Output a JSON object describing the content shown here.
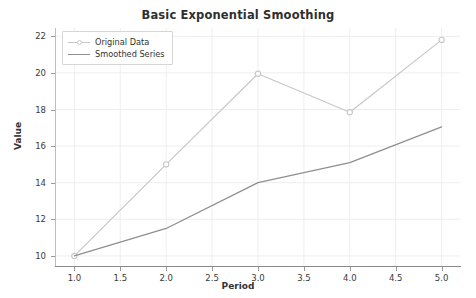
{
  "chart_data": {
    "type": "line",
    "title": "Basic Exponential Smoothing",
    "xlabel": "Period",
    "ylabel": "Value",
    "x": [
      1.0,
      2.0,
      3.0,
      4.0,
      5.0
    ],
    "series": [
      {
        "name": "Original Data",
        "values": [
          10.0,
          15.0,
          19.95,
          17.85,
          21.8
        ],
        "color": "#c8c8c8",
        "marker": "circle",
        "linewidth": 1.2
      },
      {
        "name": "Smoothed Series",
        "values": [
          10.0,
          11.5,
          14.0,
          15.1,
          17.05
        ],
        "color": "#8f8f8f",
        "marker": "none",
        "linewidth": 1.3
      }
    ],
    "xlim": [
      0.8,
      5.2
    ],
    "ylim": [
      9.45,
      22.45
    ],
    "xticks": [
      "1.0",
      "1.5",
      "2.0",
      "2.5",
      "3.0",
      "3.5",
      "4.0",
      "4.5",
      "5.0"
    ],
    "xtick_values": [
      1.0,
      1.5,
      2.0,
      2.5,
      3.0,
      3.5,
      4.0,
      4.5,
      5.0
    ],
    "yticks": [
      "10",
      "12",
      "14",
      "16",
      "18",
      "20",
      "22"
    ],
    "ytick_values": [
      10,
      12,
      14,
      16,
      18,
      20,
      22
    ],
    "grid": true,
    "grid_color": "#eeeeee",
    "legend_position": "upper left",
    "background": "#ffffff"
  }
}
